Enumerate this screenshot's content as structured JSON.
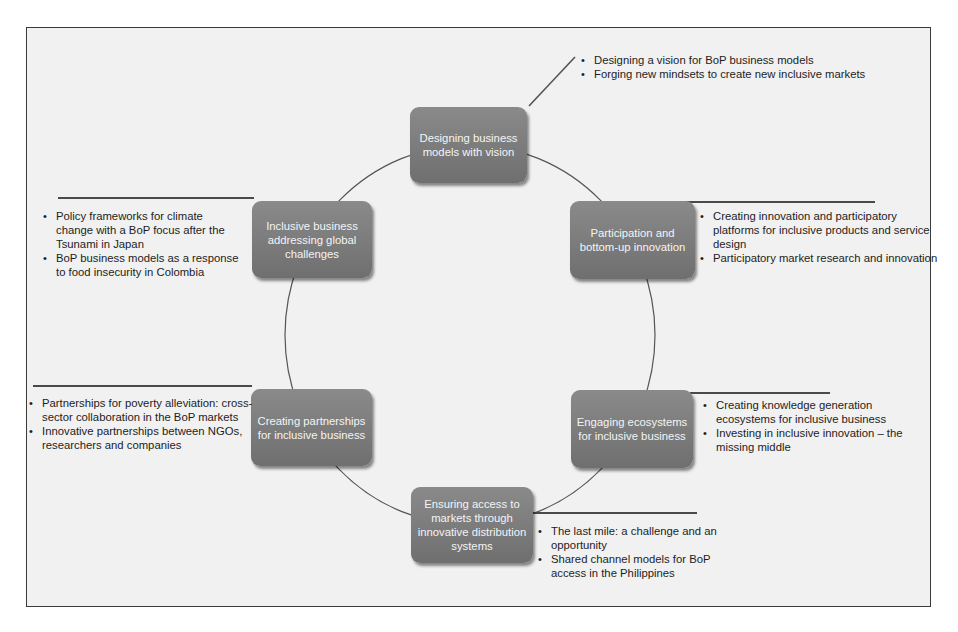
{
  "diagram": {
    "type": "cycle",
    "nodes": [
      {
        "label": "Designing business models with vision",
        "bullets": [
          "Designing a vision for BoP business models",
          "Forging new mindsets to create new inclusive markets"
        ]
      },
      {
        "label": "Participation and bottom-up innovation",
        "bullets": [
          "Creating innovation and participatory platforms for inclusive products and service design",
          "Participatory market research and innovation"
        ]
      },
      {
        "label": "Engaging ecosystems for inclusive business",
        "bullets": [
          "Creating knowledge generation ecosystems for inclusive business",
          "Investing in inclusive innovation – the missing middle"
        ]
      },
      {
        "label": "Ensuring access to markets through innovative distribution systems",
        "bullets": [
          "The last mile: a challenge and an opportunity",
          "Shared channel models for BoP access in the Philippines"
        ]
      },
      {
        "label": "Creating partnerships for inclusive business",
        "bullets": [
          "Partnerships for poverty alleviation: cross-sector collaboration in the BoP markets",
          "Innovative partnerships between NGOs, researchers and companies"
        ]
      },
      {
        "label": "Inclusive business addressing global challenges",
        "bullets": [
          "Policy frameworks for climate change with a BoP focus after the Tsunami in Japan",
          "BoP business models as a response to food insecurity in Colombia"
        ]
      }
    ]
  },
  "colors": {
    "node_fill": "#7d7d7d",
    "node_text": "#f4f4f4",
    "background": "#f1f1f1",
    "line": "#4a4a4a"
  }
}
